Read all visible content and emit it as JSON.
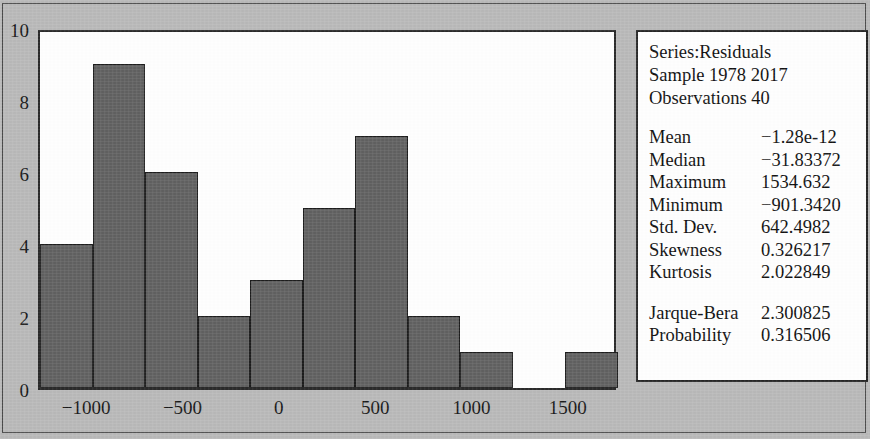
{
  "chart_data": {
    "type": "bar",
    "title": "",
    "xlabel": "",
    "ylabel": "",
    "xlim": [
      -1250,
      1750
    ],
    "ylim": [
      0,
      10
    ],
    "grid": false,
    "legend": "none",
    "bar_color": "#616161",
    "bar_edge_color": "#1d1d1d",
    "bin_width": 250,
    "bin_starts": [
      -1000,
      -750,
      -500,
      -250,
      0,
      250,
      500,
      750,
      1000,
      1250,
      1500
    ],
    "categories": [
      "-1000",
      "-750",
      "-500",
      "-250",
      "0",
      "250",
      "500",
      "750",
      "1000",
      "1250",
      "1500"
    ],
    "values": [
      4,
      9,
      6,
      2,
      3,
      5,
      7,
      2,
      1,
      0,
      1
    ],
    "y_ticks": [
      0,
      2,
      4,
      6,
      8,
      10
    ],
    "y_tick_labels": [
      "0",
      "2",
      "4",
      "6",
      "8",
      "10"
    ],
    "x_ticks": [
      -1000,
      -500,
      0,
      500,
      1000,
      1500
    ],
    "x_tick_labels": [
      "−1000",
      "−500",
      "0",
      "500",
      "1000",
      "1500"
    ]
  },
  "stats_box": {
    "header": [
      "Series:Residuals",
      "Sample 1978 2017",
      "Observations 40"
    ],
    "rows": [
      {
        "label": "Mean",
        "value": "−1.28e-12"
      },
      {
        "label": "Median",
        "value": "−31.83372"
      },
      {
        "label": "Maximum",
        "value": "1534.632"
      },
      {
        "label": "Minimum",
        "value": "−901.3420"
      },
      {
        "label": "Std. Dev.",
        "value": "642.4982"
      },
      {
        "label": "Skewness",
        "value": "0.326217"
      },
      {
        "label": "Kurtosis",
        "value": "2.022849"
      }
    ],
    "rows2": [
      {
        "label": "Jarque-Bera",
        "value": "2.300825"
      },
      {
        "label": "Probability",
        "value": "0.316506"
      }
    ]
  },
  "colors": {
    "background": "#b9b9b9",
    "plot_background": "#ffffff",
    "frame": "#2b2b2b",
    "bar_fill": "#616161",
    "text": "#111111"
  }
}
